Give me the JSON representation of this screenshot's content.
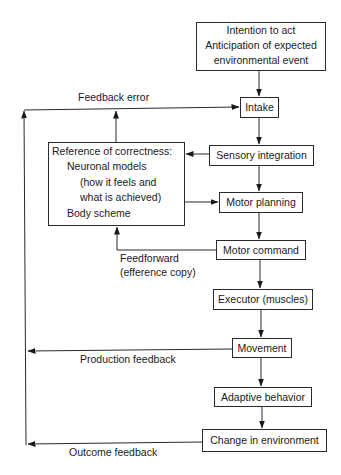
{
  "diagram": {
    "type": "flowchart",
    "nodes": {
      "intention": {
        "lines": [
          "Intention to act",
          "Anticipation of expected",
          "environmental event"
        ]
      },
      "intake": {
        "label": "Intake"
      },
      "sensory_integration": {
        "label": "Sensory integration"
      },
      "reference": {
        "lines": [
          "Reference of correctness:",
          "Neuronal models",
          "(how it feels and",
          "what is achieved)",
          "Body scheme"
        ]
      },
      "motor_planning": {
        "label": "Motor planning"
      },
      "motor_command": {
        "label": "Motor command"
      },
      "executor": {
        "label": "Executor (muscles)"
      },
      "movement": {
        "label": "Movement"
      },
      "adaptive_behavior": {
        "label": "Adaptive behavior"
      },
      "change_in_environment": {
        "label": "Change in environment"
      }
    },
    "edge_labels": {
      "feedback_error": "Feedback error",
      "feedforward": "Feedforward",
      "efference_copy": "(efference copy)",
      "production_feedback": "Production feedback",
      "outcome_feedback": "Outcome feedback"
    },
    "edges": [
      {
        "from": "intention",
        "to": "intake"
      },
      {
        "from": "intake",
        "to": "sensory_integration"
      },
      {
        "from": "sensory_integration",
        "to": "reference"
      },
      {
        "from": "sensory_integration",
        "to": "motor_planning"
      },
      {
        "from": "reference",
        "to": "motor_planning"
      },
      {
        "from": "reference",
        "to": "intake",
        "label": "Feedback error"
      },
      {
        "from": "motor_planning",
        "to": "motor_command"
      },
      {
        "from": "motor_command",
        "to": "reference",
        "label": "Feedforward (efference copy)"
      },
      {
        "from": "motor_command",
        "to": "executor"
      },
      {
        "from": "executor",
        "to": "movement"
      },
      {
        "from": "movement",
        "to": "intake",
        "label": "Production feedback"
      },
      {
        "from": "movement",
        "to": "adaptive_behavior"
      },
      {
        "from": "adaptive_behavior",
        "to": "change_in_environment"
      },
      {
        "from": "change_in_environment",
        "to": "intake",
        "label": "Outcome feedback"
      }
    ]
  }
}
